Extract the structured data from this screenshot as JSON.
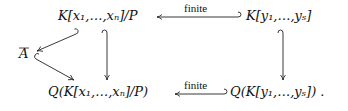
{
  "diagram": {
    "nodes": {
      "top_left": "K[x₁,…,xₙ]/P",
      "top_right": "K[y₁,…,yₛ]",
      "left": "A",
      "bottom_left": "Q(K[x₁,…,xₙ]/P)",
      "bottom_right": "Q(K[y₁,…,yₛ]) ."
    },
    "edges": [
      {
        "from": "top_right",
        "to": "top_left",
        "label": "finite",
        "style": "hook-arrow"
      },
      {
        "from": "bottom_right",
        "to": "bottom_left",
        "label": "finite",
        "style": "hook-arrow"
      },
      {
        "from": "top_left",
        "to": "bottom_left",
        "label": "",
        "style": "hook-arrow"
      },
      {
        "from": "top_right",
        "to": "bottom_right",
        "label": "",
        "style": "hook-arrow"
      },
      {
        "from": "top_left",
        "to": "left",
        "label": "",
        "style": "hook-arrow"
      },
      {
        "from": "left",
        "to": "bottom_left",
        "label": "",
        "style": "hook-arrow"
      }
    ],
    "labels": {
      "top_arrow": "finite",
      "bottom_arrow": "finite"
    }
  }
}
